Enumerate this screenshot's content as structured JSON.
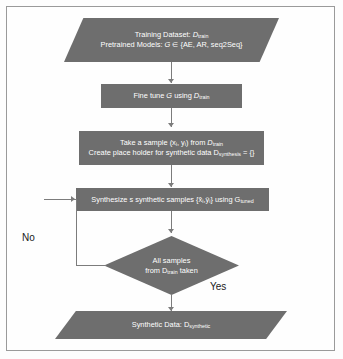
{
  "diagram": {
    "colors": {
      "node_fill": "#6e6e6e",
      "node_text": "#ffffff",
      "connector": "#7c7c7c",
      "frame_border": "#9a9a9a",
      "background": "#fdfdfd",
      "label_text": "#1a1a1a"
    },
    "nodes": [
      {
        "id": "input",
        "shape": "parallelogram",
        "lines": [
          "Training Dataset: D_train",
          "Pretrained Models: G ∈ {AE, AR, seq2Seq}"
        ]
      },
      {
        "id": "finetune",
        "shape": "rectangle",
        "lines": [
          "Fine tune G using D_train"
        ]
      },
      {
        "id": "sample",
        "shape": "rectangle",
        "lines": [
          "Take a sample (xᵢ, yᵢ) from D_train",
          "Create place holder for synthetic data D_synthesis = {}"
        ]
      },
      {
        "id": "synthesize",
        "shape": "rectangle",
        "lines": [
          "Synthesize s synthetic samples {x̂ᵢ,ŷᵢ} using G_tuned"
        ]
      },
      {
        "id": "decision",
        "shape": "diamond",
        "lines": [
          "All samples",
          "from D_train taken"
        ]
      },
      {
        "id": "output",
        "shape": "parallelogram",
        "lines": [
          "Synthetic Data: D_synthetic"
        ]
      }
    ],
    "edge_labels": {
      "no": "No",
      "yes": "Yes"
    },
    "text": {
      "input_line1_main": "Training Dataset: ",
      "input_line1_var": "D",
      "input_line1_sub": "train",
      "input_line2_main": "Pretrained Models: ",
      "input_line2_var": "G",
      "input_line2_rest": " ∈ {AE, AR, seq2Seq}",
      "finetune_main": "Fine tune ",
      "finetune_var": "G",
      "finetune_mid": " using ",
      "finetune_var2": "D",
      "finetune_sub": "train",
      "sample_line1_main": "Take a sample (x",
      "sample_line1_sub1": "i",
      "sample_line1_mid": ", y",
      "sample_line1_sub2": "i",
      "sample_line1_mid2": ") from ",
      "sample_line1_var": "D",
      "sample_line1_sub3": "train",
      "sample_line2_main": "Create place holder for synthetic data D",
      "sample_line2_sub": "synthesis",
      "sample_line2_rest": " = {}",
      "synth_main": "Synthesize s synthetic samples {x̂",
      "synth_sub1": "i",
      "synth_mid": ",ŷ",
      "synth_sub2": "i",
      "synth_mid2": "} using G",
      "synth_sub3": "tuned",
      "decision_line1": "All samples",
      "decision_line2_main": "from D",
      "decision_line2_sub": "train",
      "decision_line2_rest": " taken",
      "output_main": "Synthetic Data: D",
      "output_sub": "synthetic"
    }
  }
}
